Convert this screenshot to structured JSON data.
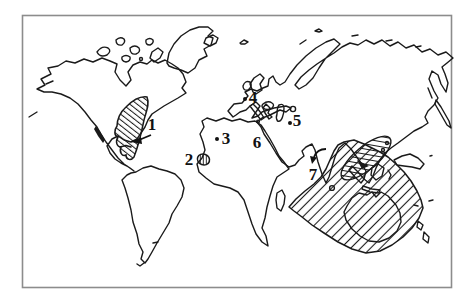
{
  "figure": {
    "kind": "hand-drawn world distribution map",
    "frame": true
  },
  "map": {
    "labels": [
      {
        "text": "1"
      },
      {
        "text": "2"
      },
      {
        "text": "3"
      },
      {
        "text": "4"
      },
      {
        "text": "5"
      },
      {
        "text": "6"
      },
      {
        "text": "7"
      }
    ],
    "markers": {
      "site1": "arrow pointing left into hatched Caribbean region",
      "site2": "small hatched spot on northwest African coast",
      "site3": "dot in North Africa",
      "site4": "dot in central Europe",
      "site5": "dot near Caspian region",
      "site6": "label beside Red Sea",
      "site7": "curved arrow pointing to southern India"
    },
    "hatched_regions": [
      "caribbean-southeast-us",
      "northwest-africa-coastal-spot",
      "indo-pacific-indian-ocean",
      "southeast-asia-crosshatch-ellipse"
    ],
    "colors": {
      "ink": "#1a1a1a",
      "frame": "#8c8c8c",
      "background": "#ffffff"
    }
  }
}
